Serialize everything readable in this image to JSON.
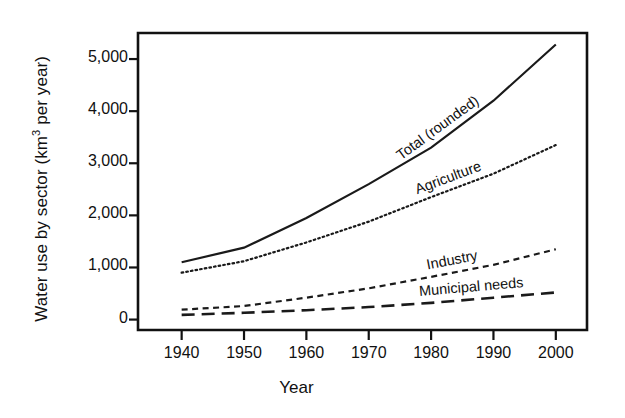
{
  "chart_data": {
    "type": "line",
    "title": "",
    "xlabel": "Year",
    "ylabel": "Water use by sector (km3 per year)",
    "ylabel_prefix": "Water use by sector (km",
    "ylabel_sup": "3",
    "ylabel_suffix": " per year)",
    "x": [
      1940,
      1950,
      1960,
      1970,
      1980,
      1990,
      2000
    ],
    "xlim": [
      1933,
      2005
    ],
    "ylim": [
      -200,
      5500
    ],
    "xticks": [
      "1940",
      "1950",
      "1960",
      "1970",
      "1980",
      "1990",
      "2000"
    ],
    "yticks": [
      "5,000",
      "4,000",
      "3,000",
      "2,000",
      "1,000",
      "0"
    ],
    "ytickvalues": [
      5000,
      4000,
      3000,
      2000,
      1000,
      0
    ],
    "grid": false,
    "legend_position": "inline-labels",
    "series": [
      {
        "name": "Total (rounded)",
        "label": "Total (rounded)",
        "style": "solid",
        "values": [
          1100,
          1380,
          1950,
          2600,
          3300,
          4200,
          5280
        ]
      },
      {
        "name": "Agriculture",
        "label": "Agriculture",
        "style": "dotted",
        "values": [
          900,
          1120,
          1480,
          1880,
          2350,
          2800,
          3350
        ]
      },
      {
        "name": "Industry",
        "label": "Industry",
        "style": "dashed",
        "values": [
          190,
          260,
          420,
          600,
          820,
          1050,
          1350
        ]
      },
      {
        "name": "Municipal needs",
        "label": "Municipal needs",
        "style": "long-dashed",
        "values": [
          90,
          130,
          180,
          240,
          320,
          420,
          520
        ]
      }
    ],
    "colors": {
      "line": "#1a1a1a",
      "frame": "#111111",
      "background": "#ffffff"
    }
  }
}
